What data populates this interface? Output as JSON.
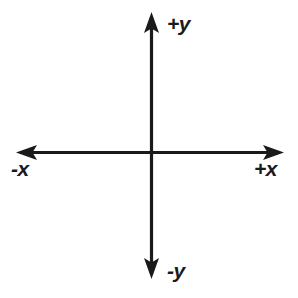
{
  "diagram": {
    "background_color": "#ffffff",
    "stroke_color": "#1a1a1a",
    "labels": {
      "positive_y": "+y",
      "negative_y": "-y",
      "positive_x": "+x",
      "negative_x": "+x"
    },
    "axis_labels": {
      "positive_y": "+y",
      "negative_y": "-y",
      "positive_x": "+x",
      "negative_x": "-x"
    },
    "geometry": {
      "origin_x": 152,
      "origin_y": 152,
      "x_axis_left_tip": 16,
      "x_axis_right_tip": 284,
      "y_axis_top_tip": 12,
      "y_axis_bottom_tip": 279,
      "line_width": 3,
      "arrow_half_width": 7,
      "arrow_length": 19
    }
  }
}
